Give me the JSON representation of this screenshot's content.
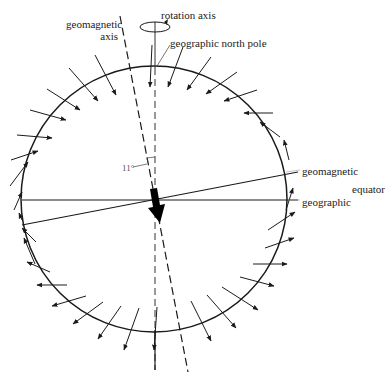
{
  "diagram": {
    "labels": {
      "geomagnetic_axis_line1": "geomagnetic",
      "geomagnetic_axis_line2": "axis",
      "rotation_axis": "rotation axis",
      "geographic_north_pole": "geographic north pole",
      "angle": "11°",
      "geomagnetic": "geomagnetic",
      "equator": "equator",
      "geographic": "geographic"
    },
    "colors": {
      "line": "#1a1a1a",
      "text": "#222222",
      "background": "#ffffff"
    },
    "earth": {
      "cx": 154,
      "cy": 199,
      "r": 133
    },
    "tilt_degrees": 11
  }
}
